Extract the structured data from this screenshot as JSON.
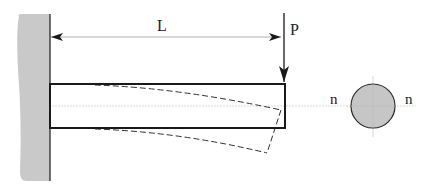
{
  "diagram": {
    "type": "cantilever-beam-bending",
    "labels": {
      "length": "L",
      "load": "P",
      "neutral_axis_left": "n",
      "neutral_axis_right": "n"
    },
    "colors": {
      "wall_fill": "#c9c9c9",
      "section_fill": "#c6c6c6",
      "line": "#1a1a1a",
      "centerline": "#c8c8c8",
      "dimension": "#9a9a9a"
    },
    "elements": [
      {
        "id": "fixed-wall",
        "description": "Gray shaded fixed support on left"
      },
      {
        "id": "length-dimension",
        "description": "Double-headed arrow labeled L spanning beam length"
      },
      {
        "id": "load-arrow",
        "description": "Downward arrow labeled P at free end"
      },
      {
        "id": "beam-undeformed",
        "description": "Solid rectangle beam"
      },
      {
        "id": "beam-deflected",
        "description": "Dashed deflected beam shape"
      },
      {
        "id": "cross-section",
        "description": "Circular cross-section with neutral axis n-n"
      }
    ]
  }
}
